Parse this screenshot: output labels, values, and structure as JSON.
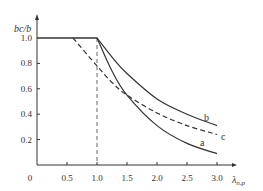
{
  "chart_data": {
    "type": "line",
    "title": "",
    "xlabel": "λn.p",
    "ylabel": "bc/b",
    "xlim": [
      0,
      3.2
    ],
    "ylim": [
      0,
      1.1
    ],
    "x_ticks": [
      "0",
      "0.5",
      "1.0",
      "1.5",
      "2.0",
      "2.5",
      "3.0"
    ],
    "y_ticks": [
      "0.2",
      "0.4",
      "0.6",
      "0.8",
      "1.0"
    ],
    "grid": false,
    "annotations": [
      {
        "type": "vertical-dashed-line",
        "x": 1.0
      }
    ],
    "series": [
      {
        "name": "a",
        "style": "solid",
        "x": [
          0,
          1.0,
          1.25,
          1.5,
          2.0,
          2.5,
          3.0
        ],
        "y": [
          1.0,
          1.0,
          0.74,
          0.55,
          0.31,
          0.17,
          0.09
        ]
      },
      {
        "name": "b",
        "style": "solid",
        "x": [
          0,
          1.0,
          1.25,
          1.5,
          2.0,
          2.5,
          3.0
        ],
        "y": [
          1.0,
          1.0,
          0.85,
          0.72,
          0.52,
          0.4,
          0.31
        ]
      },
      {
        "name": "c",
        "style": "dashed",
        "x": [
          0.6,
          1.0,
          1.25,
          1.5,
          2.0,
          2.5,
          3.0
        ],
        "y": [
          1.0,
          0.78,
          0.65,
          0.55,
          0.41,
          0.31,
          0.24
        ]
      }
    ]
  },
  "labels": {
    "y_axis": "bc/b",
    "x_axis_main": "λ",
    "x_axis_sub": "n.p",
    "series_a": "a",
    "series_b": "b",
    "series_c": "c"
  }
}
